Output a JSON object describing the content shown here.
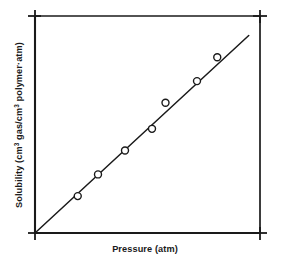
{
  "chart_data": {
    "type": "scatter",
    "title": "",
    "subtitle": "",
    "xlabel": "Pressure (atm)",
    "ylabel": "Solubility (cm³ gas/cm³ polymer·atm)",
    "ylabel_parts": {
      "segment_1": "Solubility (cm",
      "sup_1": "3",
      "segment_2": " gas/cm",
      "sup_2": "3",
      "segment_3": " polymer·atm)"
    },
    "xlabel_parts": {
      "segment_1": "Pressure (atm)"
    },
    "grid": false,
    "legend": "none",
    "xlim": [
      0,
      10
    ],
    "ylim": [
      0,
      10
    ],
    "xticklabels": [],
    "yticklabels": [],
    "axis_ticks_visible": true,
    "tick_positions": [
      "top-left",
      "top-right",
      "bottom-left",
      "bottom-right"
    ],
    "marker": "open-circle",
    "marker_size_px": 7,
    "series": [
      {
        "name": "Solubility data",
        "marker": "open-circle",
        "points": [
          {
            "x": 1.9,
            "y": 1.7
          },
          {
            "x": 2.8,
            "y": 2.7
          },
          {
            "x": 4.0,
            "y": 3.8
          },
          {
            "x": 5.2,
            "y": 4.8
          },
          {
            "x": 5.8,
            "y": 6.0
          },
          {
            "x": 7.2,
            "y": 7.0
          },
          {
            "x": 8.1,
            "y": 8.1
          }
        ],
        "x_values": [
          1.9,
          2.8,
          4.0,
          5.2,
          5.8,
          7.2,
          8.1
        ],
        "y_values": [
          1.7,
          2.7,
          3.8,
          4.8,
          6.0,
          7.0,
          8.1
        ]
      }
    ],
    "fit_line": {
      "name": "Linear fit (Henry's law)",
      "x_start": 0.0,
      "y_start": 0.0,
      "x_end": 9.5,
      "y_end": 9.1,
      "slope": 0.96,
      "intercept": 0.0
    },
    "colors": {
      "axis": "#1a1a1a",
      "line": "#1a1a1a",
      "marker_stroke": "#1a1a1a",
      "marker_fill": "#ffffff",
      "background": "#ffffff",
      "text": "#1a1a1a"
    }
  }
}
